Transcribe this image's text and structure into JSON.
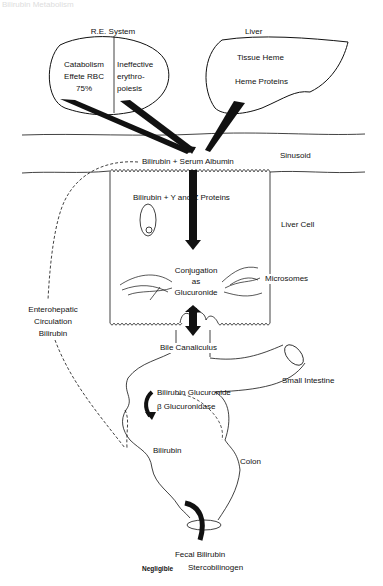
{
  "diagram": {
    "header_faded": "Bilirubin Metabolism",
    "re_system": {
      "title": "R.E. System",
      "left_text": [
        "Catabolism",
        "Effete RBC",
        "75%"
      ],
      "right_text": [
        "Ineffective",
        "erythro-",
        "poiesis"
      ]
    },
    "liver": {
      "title": "Liver",
      "line1": "Tissue Heme",
      "line2": "Heme  Proteins"
    },
    "sinusoid": {
      "label": "Sinusoid",
      "reaction": "Bilirubin + Serum Albumin"
    },
    "liver_cell": {
      "label": "Liver Cell",
      "reaction": "Bilirubin + Y and Z Proteins",
      "conjugation": [
        "Conjugation",
        "as",
        "Glucuronide"
      ],
      "microsomes": "Microsomes"
    },
    "enterohepatic": [
      "Enterohepatic",
      "Circulation",
      "Bilirubin"
    ],
    "bile_canaliculus": "Bile Canaliculus",
    "small_intestine": "Small Intestine",
    "intestine_reaction": {
      "line1": "Bilirubin Glucuronide",
      "line2": "β Glucuronidase"
    },
    "colon": {
      "label": "Colon",
      "content": "Bilirubin"
    },
    "output": {
      "line1": "Fecal Bilirubin",
      "line2_bold": "Negligible",
      "line2": "Stercobilinogen"
    }
  }
}
